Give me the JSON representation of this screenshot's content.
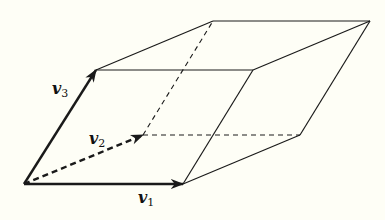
{
  "diagram": {
    "background": "#fefef6",
    "stroke": "#1a1a1a",
    "vertices": {
      "O": [
        24,
        184
      ],
      "v1": [
        183,
        184
      ],
      "v2": [
        143,
        135
      ],
      "v3": [
        96,
        70
      ],
      "v1v3": [
        253,
        70
      ],
      "v2v3": [
        213,
        21
      ],
      "v1v2": [
        300,
        135
      ],
      "v1v2v3": [
        370,
        21
      ]
    },
    "labels": {
      "v1": {
        "base": "v",
        "sub": "1"
      },
      "v2": {
        "base": "v",
        "sub": "2"
      },
      "v3": {
        "base": "v",
        "sub": "3"
      }
    },
    "edges": {
      "solid": [
        [
          "v3",
          "v1v3"
        ],
        [
          "v3",
          "v2v3"
        ],
        [
          "v2v3",
          "v1v2v3"
        ],
        [
          "v1v3",
          "v1v2v3"
        ],
        [
          "v1",
          "v1v3"
        ],
        [
          "v1",
          "v1v2"
        ],
        [
          "v1v2",
          "v1v2v3"
        ]
      ],
      "dashed": [
        [
          "v2",
          "v2v3"
        ],
        [
          "v2",
          "v1v2"
        ]
      ],
      "vectors": [
        {
          "name": "v1",
          "from": "O",
          "to": "v1",
          "style": "solid"
        },
        {
          "name": "v2",
          "from": "O",
          "to": "v2",
          "style": "dashed"
        },
        {
          "name": "v3",
          "from": "O",
          "to": "v3",
          "style": "solid"
        }
      ]
    }
  }
}
